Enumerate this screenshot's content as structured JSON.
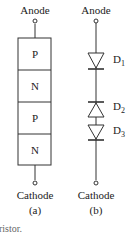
{
  "figure_a": {
    "anode_label": "Anode",
    "cathode_label": "Cathode",
    "sublabel": "(a)",
    "layers": [
      "P",
      "N",
      "P",
      "N"
    ]
  },
  "figure_b": {
    "anode_label": "Anode",
    "cathode_label": "Cathode",
    "sublabel": "(b)",
    "diodes": [
      {
        "name": "D",
        "sub": "1",
        "direction": "down"
      },
      {
        "name": "D",
        "sub": "2",
        "direction": "up"
      },
      {
        "name": "D",
        "sub": "3",
        "direction": "down"
      }
    ]
  },
  "caption": "ristor."
}
